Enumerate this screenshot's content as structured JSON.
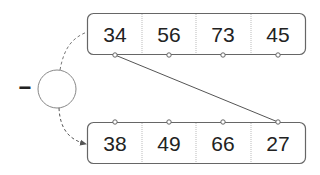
{
  "diagram": {
    "operator_symbol": "−",
    "top_array": {
      "values": [
        "34",
        "56",
        "73",
        "45"
      ]
    },
    "bottom_array": {
      "values": [
        "38",
        "49",
        "66",
        "27"
      ]
    },
    "connection": {
      "from": "top_array.0",
      "to": "bottom_array.3"
    },
    "colors": {
      "stroke": "#666666",
      "text": "#222222"
    }
  }
}
